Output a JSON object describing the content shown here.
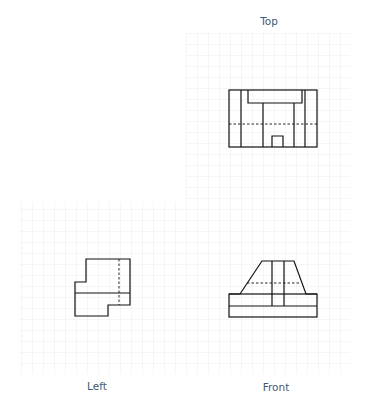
{
  "labels": {
    "top": "Top",
    "left": "Left",
    "front": "Front"
  },
  "colors": {
    "grid_line": "#e6e6e6",
    "outline": "#111111",
    "label": "#3d5a78"
  },
  "views": [
    {
      "name": "top",
      "label": "Top"
    },
    {
      "name": "front",
      "label": "Front"
    },
    {
      "name": "left",
      "label": "Left"
    }
  ]
}
